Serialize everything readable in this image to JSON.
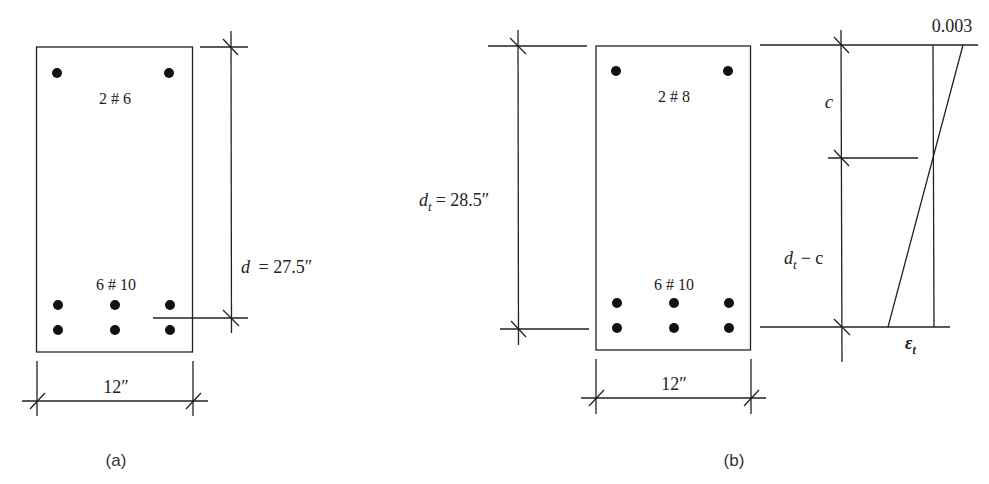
{
  "figure_a": {
    "caption": "(a)",
    "top_bars_label": "2 # 6",
    "bottom_bars_label": "6 # 10",
    "depth_label_var": "d",
    "depth_label_value": "= 27.5″",
    "width_label": "12″"
  },
  "figure_b": {
    "caption": "(b)",
    "top_bars_label": "2 # 8",
    "bottom_bars_label": "6 # 10",
    "depth_label_var": "d",
    "depth_label_sub": "t",
    "depth_label_value": "= 28.5″",
    "width_label": "12″",
    "strain_diagram": {
      "top_strain": "0.003",
      "neutral_axis_depth": "c",
      "lower_var": "d",
      "lower_sub": "t",
      "lower_rest": "− c",
      "bottom_strain_var": "ε",
      "bottom_strain_sub": "t"
    }
  },
  "colors": {
    "line": "#222222",
    "bars": "#111111",
    "background": "#ffffff"
  }
}
